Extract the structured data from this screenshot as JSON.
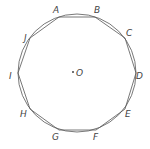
{
  "diagram": {
    "type": "inscribed-decagon",
    "circle": {
      "cx": 77,
      "cy": 73,
      "r": 59
    },
    "center": {
      "label": "O",
      "x": 77,
      "y": 73
    },
    "vertices": [
      {
        "label": "A",
        "x": 59,
        "y": 17,
        "lx": 53,
        "ly": 13
      },
      {
        "label": "B",
        "x": 95,
        "y": 17,
        "lx": 94,
        "ly": 13
      },
      {
        "label": "C",
        "x": 125,
        "y": 38,
        "lx": 126,
        "ly": 36
      },
      {
        "label": "D",
        "x": 136,
        "y": 73,
        "lx": 136,
        "ly": 79
      },
      {
        "label": "E",
        "x": 125,
        "y": 109,
        "lx": 125,
        "ly": 117
      },
      {
        "label": "F",
        "x": 96,
        "y": 130,
        "lx": 93,
        "ly": 140
      },
      {
        "label": "G",
        "x": 59,
        "y": 130,
        "lx": 52,
        "ly": 140
      },
      {
        "label": "H",
        "x": 30,
        "y": 109,
        "lx": 20,
        "ly": 117
      },
      {
        "label": "I",
        "x": 18,
        "y": 73,
        "lx": 9,
        "ly": 79
      },
      {
        "label": "J",
        "x": 30,
        "y": 38,
        "lx": 24,
        "ly": 41
      }
    ],
    "colors": {
      "stroke": "#555555",
      "text": "#444444"
    }
  }
}
